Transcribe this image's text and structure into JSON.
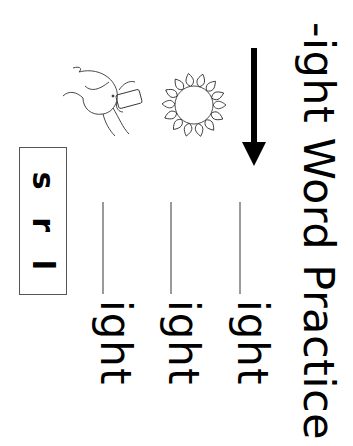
{
  "worksheet": {
    "title": "-ight Word Practice",
    "orientation": "rotated 90deg clockwise",
    "pictures": [
      {
        "name": "girl-with-camera",
        "label": "sight/camera"
      },
      {
        "name": "sun",
        "label": "light"
      }
    ],
    "rows": [
      {
        "blank": "",
        "suffix": "ight"
      },
      {
        "blank": "",
        "suffix": "ight"
      },
      {
        "blank": "",
        "suffix": "ight"
      }
    ],
    "letter_bank": [
      "s",
      "r",
      "l"
    ],
    "colors": {
      "text": "#000000",
      "writing_line": "#9a9a9a",
      "box_border": "#555555",
      "background": "#ffffff"
    }
  }
}
